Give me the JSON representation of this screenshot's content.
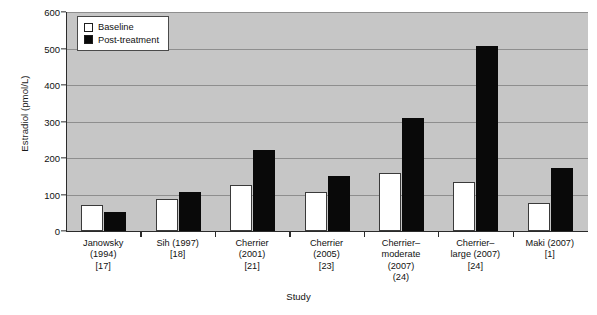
{
  "chart_data": {
    "type": "bar",
    "title": "",
    "xlabel": "Study",
    "ylabel": "Estradiol (pmol/L)",
    "ylim": [
      0,
      600
    ],
    "ytick_step": 100,
    "yticks": [
      0,
      100,
      200,
      300,
      400,
      500,
      600
    ],
    "grid": true,
    "legend_position": "top-left",
    "categories": [
      "Janowsky (1994) [17]",
      "Sih (1997) [18]",
      "Cherrier (2001) [21]",
      "Cherrier (2005) [23]",
      "Cherrier-moderate (2007) (24)",
      "Cherrier-large (2007) [24]",
      "Maki (2007) [1]"
    ],
    "category_lines": [
      [
        "Janowsky",
        "(1994)",
        "[17]"
      ],
      [
        "Sih (1997)",
        "[18]"
      ],
      [
        "Cherrier",
        "(2001)",
        "[21]"
      ],
      [
        "Cherrier",
        "(2005)",
        "[23]"
      ],
      [
        "Cherrier–",
        "moderate",
        "(2007)",
        "(24)"
      ],
      [
        "Cherrier–",
        "large (2007)",
        "[24]"
      ],
      [
        "Maki (2007)",
        "[1]"
      ]
    ],
    "series": [
      {
        "name": "Baseline",
        "color": "#ffffff",
        "values": [
          70,
          88,
          125,
          107,
          158,
          135,
          78
        ]
      },
      {
        "name": "Post-treatment",
        "color": "#090909",
        "values": [
          53,
          107,
          223,
          150,
          310,
          507,
          173
        ]
      }
    ]
  },
  "legend": {
    "items": [
      {
        "label": "Baseline"
      },
      {
        "label": "Post-treatment"
      }
    ]
  },
  "caption": {
    "text": ""
  }
}
